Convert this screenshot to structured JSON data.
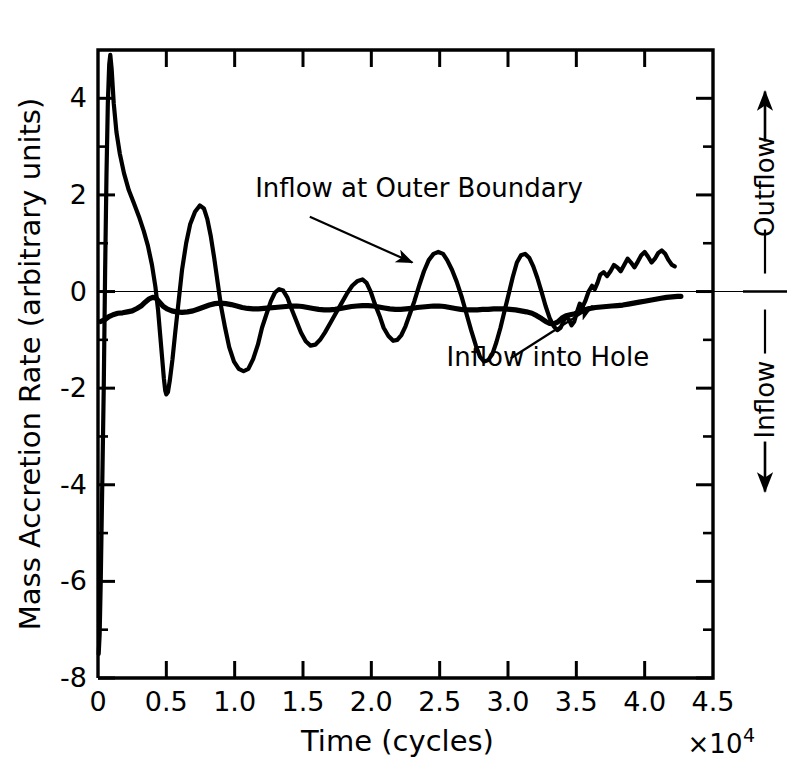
{
  "figure": {
    "background_color": "#ffffff",
    "ink_color": "#000000",
    "frame": {
      "left": 98,
      "right": 713,
      "top": 50,
      "bottom": 678
    }
  },
  "chart_data": {
    "type": "line",
    "title": "",
    "xlabel": "Time  (cycles)",
    "x_multiplier": "×10",
    "x_multiplier_exponent": "4",
    "ylabel": "Mass Accretion Rate  (arbitrary units)",
    "xlim": [
      0,
      4.5
    ],
    "ylim": [
      -8,
      5
    ],
    "grid": false,
    "zero_line": true,
    "legend_position": "inline-annotations",
    "x_ticks": [
      {
        "value": 0,
        "label": "0"
      },
      {
        "value": 0.5,
        "label": "0.5"
      },
      {
        "value": 1.0,
        "label": "1.0"
      },
      {
        "value": 1.5,
        "label": "1.5"
      },
      {
        "value": 2.0,
        "label": "2.0"
      },
      {
        "value": 2.5,
        "label": "2.5"
      },
      {
        "value": 3.0,
        "label": "3.0"
      },
      {
        "value": 3.5,
        "label": "3.5"
      },
      {
        "value": 4.0,
        "label": "4.0"
      },
      {
        "value": 4.5,
        "label": "4.5"
      }
    ],
    "x_minor_ticks": [
      0.25,
      0.75,
      1.25,
      1.75,
      2.25,
      2.75,
      3.25,
      3.75,
      4.25
    ],
    "y_ticks": [
      {
        "value": 4,
        "label": "4"
      },
      {
        "value": 2,
        "label": "2"
      },
      {
        "value": 0,
        "label": "0"
      },
      {
        "value": -2,
        "label": "-2"
      },
      {
        "value": -4,
        "label": "-4"
      },
      {
        "value": -6,
        "label": "-6"
      },
      {
        "value": -8,
        "label": "-8"
      }
    ],
    "y_minor_ticks": [
      3,
      1,
      -1,
      -3,
      -5,
      -7
    ],
    "annotations": [
      {
        "name": "inflow-at-outer-boundary",
        "text": "Inflow at Outer Boundary",
        "text_x": 1.15,
        "text_y": 1.95,
        "arrow_from": [
          1.55,
          1.55
        ],
        "arrow_to": [
          2.3,
          0.6
        ]
      },
      {
        "name": "inflow-into-hole",
        "text": "Inflow into Hole",
        "text_x": 2.55,
        "text_y": -1.55,
        "arrow_from": [
          3.02,
          -1.38
        ],
        "arrow_to": [
          3.62,
          -0.3
        ]
      }
    ],
    "right_axis_annotation": {
      "outflow_label": "Outflow",
      "inflow_label": "Inflow",
      "outflow_direction": "up",
      "inflow_direction": "down"
    },
    "series": [
      {
        "name": "Inflow at Outer Boundary",
        "line_width": 4.2,
        "color": "#000000",
        "points": [
          [
            0.005,
            -7.5
          ],
          [
            0.012,
            -7.1
          ],
          [
            0.02,
            -6.0
          ],
          [
            0.03,
            -4.2
          ],
          [
            0.042,
            -2.0
          ],
          [
            0.052,
            0.4
          ],
          [
            0.062,
            2.4
          ],
          [
            0.072,
            3.9
          ],
          [
            0.082,
            4.7
          ],
          [
            0.09,
            4.9
          ],
          [
            0.1,
            4.6
          ],
          [
            0.115,
            3.9
          ],
          [
            0.135,
            3.3
          ],
          [
            0.16,
            2.85
          ],
          [
            0.19,
            2.45
          ],
          [
            0.225,
            2.1
          ],
          [
            0.26,
            1.85
          ],
          [
            0.3,
            1.55
          ],
          [
            0.335,
            1.25
          ],
          [
            0.365,
            0.95
          ],
          [
            0.395,
            0.55
          ],
          [
            0.42,
            0.1
          ],
          [
            0.44,
            -0.4
          ],
          [
            0.455,
            -0.9
          ],
          [
            0.47,
            -1.4
          ],
          [
            0.482,
            -1.8
          ],
          [
            0.492,
            -2.05
          ],
          [
            0.5,
            -2.13
          ],
          [
            0.512,
            -2.08
          ],
          [
            0.525,
            -1.85
          ],
          [
            0.545,
            -1.4
          ],
          [
            0.565,
            -0.85
          ],
          [
            0.59,
            -0.2
          ],
          [
            0.615,
            0.45
          ],
          [
            0.645,
            1.0
          ],
          [
            0.675,
            1.4
          ],
          [
            0.71,
            1.65
          ],
          [
            0.745,
            1.78
          ],
          [
            0.775,
            1.72
          ],
          [
            0.8,
            1.5
          ],
          [
            0.825,
            1.15
          ],
          [
            0.85,
            0.7
          ],
          [
            0.875,
            0.2
          ],
          [
            0.9,
            -0.3
          ],
          [
            0.93,
            -0.75
          ],
          [
            0.96,
            -1.15
          ],
          [
            0.995,
            -1.45
          ],
          [
            1.03,
            -1.6
          ],
          [
            1.065,
            -1.65
          ],
          [
            1.1,
            -1.6
          ],
          [
            1.135,
            -1.4
          ],
          [
            1.17,
            -1.1
          ],
          [
            1.2,
            -0.75
          ],
          [
            1.235,
            -0.45
          ],
          [
            1.265,
            -0.2
          ],
          [
            1.295,
            -0.02
          ],
          [
            1.325,
            0.05
          ],
          [
            1.355,
            0.02
          ],
          [
            1.385,
            -0.12
          ],
          [
            1.415,
            -0.35
          ],
          [
            1.45,
            -0.6
          ],
          [
            1.485,
            -0.85
          ],
          [
            1.52,
            -1.03
          ],
          [
            1.555,
            -1.12
          ],
          [
            1.59,
            -1.1
          ],
          [
            1.625,
            -1.0
          ],
          [
            1.66,
            -0.85
          ],
          [
            1.7,
            -0.65
          ],
          [
            1.74,
            -0.45
          ],
          [
            1.78,
            -0.25
          ],
          [
            1.82,
            -0.05
          ],
          [
            1.86,
            0.12
          ],
          [
            1.9,
            0.22
          ],
          [
            1.935,
            0.25
          ],
          [
            1.965,
            0.18
          ],
          [
            1.995,
            0.0
          ],
          [
            2.025,
            -0.25
          ],
          [
            2.06,
            -0.5
          ],
          [
            2.09,
            -0.75
          ],
          [
            2.125,
            -0.92
          ],
          [
            2.16,
            -1.02
          ],
          [
            2.19,
            -1.0
          ],
          [
            2.22,
            -0.9
          ],
          [
            2.25,
            -0.72
          ],
          [
            2.28,
            -0.48
          ],
          [
            2.315,
            -0.2
          ],
          [
            2.35,
            0.12
          ],
          [
            2.385,
            0.42
          ],
          [
            2.42,
            0.65
          ],
          [
            2.455,
            0.78
          ],
          [
            2.49,
            0.82
          ],
          [
            2.525,
            0.78
          ],
          [
            2.555,
            0.65
          ],
          [
            2.59,
            0.45
          ],
          [
            2.625,
            0.2
          ],
          [
            2.66,
            -0.1
          ],
          [
            2.695,
            -0.45
          ],
          [
            2.73,
            -0.8
          ],
          [
            2.765,
            -1.12
          ],
          [
            2.795,
            -1.35
          ],
          [
            2.825,
            -1.45
          ],
          [
            2.855,
            -1.42
          ],
          [
            2.885,
            -1.3
          ],
          [
            2.915,
            -1.05
          ],
          [
            2.945,
            -0.75
          ],
          [
            2.975,
            -0.4
          ],
          [
            3.005,
            -0.05
          ],
          [
            3.035,
            0.3
          ],
          [
            3.065,
            0.6
          ],
          [
            3.095,
            0.75
          ],
          [
            3.125,
            0.78
          ],
          [
            3.155,
            0.7
          ],
          [
            3.185,
            0.52
          ],
          [
            3.215,
            0.28
          ],
          [
            3.245,
            0.0
          ],
          [
            3.275,
            -0.3
          ],
          [
            3.305,
            -0.55
          ],
          [
            3.335,
            -0.72
          ],
          [
            3.36,
            -0.8
          ],
          [
            3.385,
            -0.75
          ],
          [
            3.405,
            -0.62
          ],
          [
            3.425,
            -0.52
          ],
          [
            3.445,
            -0.58
          ],
          [
            3.465,
            -0.7
          ],
          [
            3.485,
            -0.62
          ],
          [
            3.505,
            -0.42
          ],
          [
            3.525,
            -0.25
          ],
          [
            3.545,
            -0.32
          ],
          [
            3.565,
            -0.2
          ],
          [
            3.59,
            0.0
          ],
          [
            3.615,
            0.12
          ],
          [
            3.635,
            0.05
          ],
          [
            3.655,
            0.18
          ],
          [
            3.675,
            0.35
          ],
          [
            3.7,
            0.4
          ],
          [
            3.725,
            0.32
          ],
          [
            3.75,
            0.42
          ],
          [
            3.775,
            0.55
          ],
          [
            3.8,
            0.5
          ],
          [
            3.825,
            0.42
          ],
          [
            3.85,
            0.55
          ],
          [
            3.875,
            0.68
          ],
          [
            3.9,
            0.6
          ],
          [
            3.925,
            0.5
          ],
          [
            3.95,
            0.62
          ],
          [
            3.975,
            0.75
          ],
          [
            4.0,
            0.82
          ],
          [
            4.025,
            0.72
          ],
          [
            4.05,
            0.6
          ],
          [
            4.075,
            0.68
          ],
          [
            4.1,
            0.8
          ],
          [
            4.125,
            0.85
          ],
          [
            4.15,
            0.78
          ],
          [
            4.175,
            0.65
          ],
          [
            4.2,
            0.55
          ],
          [
            4.22,
            0.52
          ]
        ]
      },
      {
        "name": "Inflow into Hole",
        "line_width": 5.2,
        "color": "#000000",
        "points": [
          [
            0.02,
            -0.62
          ],
          [
            0.05,
            -0.58
          ],
          [
            0.08,
            -0.52
          ],
          [
            0.11,
            -0.48
          ],
          [
            0.145,
            -0.45
          ],
          [
            0.18,
            -0.44
          ],
          [
            0.215,
            -0.42
          ],
          [
            0.25,
            -0.4
          ],
          [
            0.285,
            -0.35
          ],
          [
            0.315,
            -0.3
          ],
          [
            0.345,
            -0.22
          ],
          [
            0.375,
            -0.15
          ],
          [
            0.4,
            -0.12
          ],
          [
            0.425,
            -0.14
          ],
          [
            0.45,
            -0.22
          ],
          [
            0.475,
            -0.3
          ],
          [
            0.505,
            -0.36
          ],
          [
            0.54,
            -0.4
          ],
          [
            0.575,
            -0.42
          ],
          [
            0.615,
            -0.43
          ],
          [
            0.655,
            -0.42
          ],
          [
            0.695,
            -0.4
          ],
          [
            0.735,
            -0.36
          ],
          [
            0.775,
            -0.32
          ],
          [
            0.815,
            -0.28
          ],
          [
            0.855,
            -0.25
          ],
          [
            0.895,
            -0.24
          ],
          [
            0.935,
            -0.25
          ],
          [
            0.975,
            -0.27
          ],
          [
            1.015,
            -0.3
          ],
          [
            1.055,
            -0.33
          ],
          [
            1.095,
            -0.35
          ],
          [
            1.135,
            -0.36
          ],
          [
            1.175,
            -0.36
          ],
          [
            1.215,
            -0.35
          ],
          [
            1.255,
            -0.34
          ],
          [
            1.295,
            -0.33
          ],
          [
            1.335,
            -0.32
          ],
          [
            1.375,
            -0.31
          ],
          [
            1.415,
            -0.3
          ],
          [
            1.455,
            -0.3
          ],
          [
            1.495,
            -0.31
          ],
          [
            1.535,
            -0.33
          ],
          [
            1.575,
            -0.35
          ],
          [
            1.615,
            -0.37
          ],
          [
            1.655,
            -0.38
          ],
          [
            1.695,
            -0.38
          ],
          [
            1.735,
            -0.37
          ],
          [
            1.775,
            -0.35
          ],
          [
            1.815,
            -0.33
          ],
          [
            1.855,
            -0.31
          ],
          [
            1.895,
            -0.3
          ],
          [
            1.935,
            -0.29
          ],
          [
            1.975,
            -0.29
          ],
          [
            2.015,
            -0.3
          ],
          [
            2.055,
            -0.32
          ],
          [
            2.095,
            -0.34
          ],
          [
            2.135,
            -0.36
          ],
          [
            2.175,
            -0.37
          ],
          [
            2.215,
            -0.37
          ],
          [
            2.255,
            -0.36
          ],
          [
            2.295,
            -0.35
          ],
          [
            2.335,
            -0.33
          ],
          [
            2.375,
            -0.32
          ],
          [
            2.415,
            -0.31
          ],
          [
            2.455,
            -0.3
          ],
          [
            2.495,
            -0.3
          ],
          [
            2.535,
            -0.31
          ],
          [
            2.575,
            -0.33
          ],
          [
            2.615,
            -0.35
          ],
          [
            2.655,
            -0.37
          ],
          [
            2.695,
            -0.38
          ],
          [
            2.735,
            -0.38
          ],
          [
            2.775,
            -0.38
          ],
          [
            2.815,
            -0.37
          ],
          [
            2.855,
            -0.37
          ],
          [
            2.895,
            -0.36
          ],
          [
            2.935,
            -0.36
          ],
          [
            2.975,
            -0.36
          ],
          [
            3.015,
            -0.37
          ],
          [
            3.055,
            -0.38
          ],
          [
            3.095,
            -0.4
          ],
          [
            3.135,
            -0.42
          ],
          [
            3.175,
            -0.45
          ],
          [
            3.21,
            -0.5
          ],
          [
            3.245,
            -0.56
          ],
          [
            3.275,
            -0.62
          ],
          [
            3.305,
            -0.66
          ],
          [
            3.335,
            -0.67
          ],
          [
            3.365,
            -0.63
          ],
          [
            3.395,
            -0.55
          ],
          [
            3.425,
            -0.5
          ],
          [
            3.455,
            -0.48
          ],
          [
            3.49,
            -0.46
          ],
          [
            3.525,
            -0.42
          ],
          [
            3.56,
            -0.38
          ],
          [
            3.6,
            -0.35
          ],
          [
            3.64,
            -0.33
          ],
          [
            3.68,
            -0.32
          ],
          [
            3.72,
            -0.31
          ],
          [
            3.76,
            -0.3
          ],
          [
            3.8,
            -0.29
          ],
          [
            3.84,
            -0.28
          ],
          [
            3.88,
            -0.26
          ],
          [
            3.92,
            -0.24
          ],
          [
            3.96,
            -0.22
          ],
          [
            4.0,
            -0.2
          ],
          [
            4.04,
            -0.18
          ],
          [
            4.08,
            -0.16
          ],
          [
            4.12,
            -0.14
          ],
          [
            4.16,
            -0.12
          ],
          [
            4.2,
            -0.11
          ],
          [
            4.24,
            -0.1
          ],
          [
            4.265,
            -0.1
          ]
        ]
      }
    ]
  }
}
